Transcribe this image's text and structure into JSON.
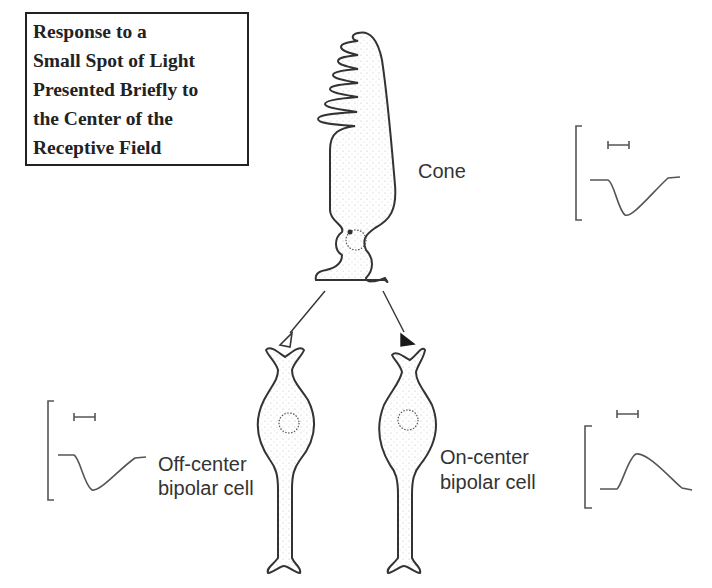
{
  "title": {
    "lines": [
      "Response to a",
      "Small Spot of Light",
      "Presented Briefly to",
      "the Center of the",
      "Receptive Field"
    ]
  },
  "labels": {
    "cone": "Cone",
    "off_center": [
      "Off-center",
      "bipolar cell"
    ],
    "on_center": [
      "On-center",
      "bipolar cell"
    ]
  },
  "synapses": {
    "off_center": "open-triangle (sign-inverting)",
    "on_center": "filled-triangle (sign-preserving)"
  },
  "traces": [
    {
      "cell": "cone",
      "response": "hyperpolarizing",
      "stimulus_bar": true
    },
    {
      "cell": "off-center bipolar cell",
      "response": "hyperpolarizing",
      "stimulus_bar": true
    },
    {
      "cell": "on-center bipolar cell",
      "response": "depolarizing",
      "stimulus_bar": true
    }
  ],
  "colors": {
    "ink": "#333333",
    "filled_triangle": "#1a1a1a",
    "stipple": "#bbbbbb"
  }
}
